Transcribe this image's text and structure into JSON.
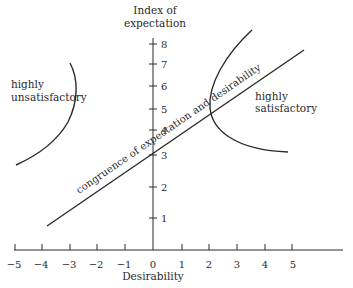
{
  "diagram": {
    "type": "expectation-desirability diagram",
    "y_axis": {
      "title_line1": "Index of",
      "title_line2": "expectation",
      "ticks": [
        "1",
        "2",
        "3",
        "4",
        "5",
        "6",
        "7",
        "8"
      ]
    },
    "x_axis": {
      "title": "Desirability",
      "ticks": [
        "−5",
        "−4",
        "−3",
        "−2",
        "−1",
        "0",
        "1",
        "2",
        "3",
        "4",
        "5"
      ]
    },
    "regions": {
      "left": {
        "line1": "highly",
        "line2": "unsatisfactory"
      },
      "right": {
        "line1": "highly",
        "line2": "satisfactory"
      }
    },
    "diagonal_label": "congruence of expectation and desirability",
    "colors": {
      "ink": "#2a2a2a",
      "background": "#ffffff"
    }
  }
}
